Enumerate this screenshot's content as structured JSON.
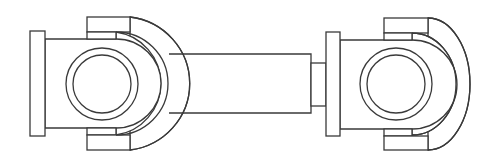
{
  "diagram": {
    "title": "Universal joint drive shaft (cardan shaft) line drawing",
    "stroke_color": "#3a3a3a",
    "background": "#ffffff",
    "components": [
      {
        "name": "left-flange",
        "type": "rect"
      },
      {
        "name": "left-yoke-body",
        "type": "rect"
      },
      {
        "name": "left-yoke-ear-top",
        "type": "rect"
      },
      {
        "name": "left-yoke-ear-bottom",
        "type": "rect"
      },
      {
        "name": "left-bearing-cap-outer",
        "type": "circle"
      },
      {
        "name": "left-bearing-cap-inner",
        "type": "circle"
      },
      {
        "name": "left-yoke-arc-inner",
        "type": "arc"
      },
      {
        "name": "left-yoke-arc-outer",
        "type": "arc"
      },
      {
        "name": "shaft-tube",
        "type": "rect"
      },
      {
        "name": "shaft-neck",
        "type": "rect"
      },
      {
        "name": "right-flange",
        "type": "rect"
      },
      {
        "name": "right-yoke-body",
        "type": "rect"
      },
      {
        "name": "right-yoke-ear-top",
        "type": "rect"
      },
      {
        "name": "right-yoke-ear-bottom",
        "type": "rect"
      },
      {
        "name": "right-bearing-cap-outer",
        "type": "circle"
      },
      {
        "name": "right-bearing-cap-inner",
        "type": "circle"
      },
      {
        "name": "right-yoke-arc-inner",
        "type": "arc"
      },
      {
        "name": "right-yoke-arc-outer",
        "type": "arc"
      }
    ]
  }
}
